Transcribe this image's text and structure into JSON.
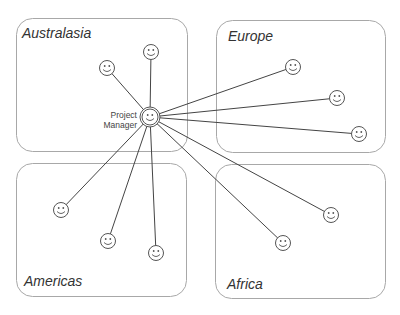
{
  "diagram": {
    "type": "hub-and-spoke organizational diagram",
    "colors": {
      "box_border": "#a8a8a8",
      "line": "#444444",
      "face": "#555555",
      "label": "#333333"
    },
    "hub": {
      "label_line1": "Project",
      "label_line2": "Manager",
      "x": 150,
      "y": 117,
      "icon": "smiley-face-icon"
    },
    "regions": [
      {
        "name": "Australasia",
        "box": [
          16,
          18,
          188,
          152
        ],
        "label_pos": [
          22,
          38
        ],
        "members": [
          {
            "x": 107,
            "y": 68
          },
          {
            "x": 151,
            "y": 52
          }
        ]
      },
      {
        "name": "Europe",
        "box": [
          216,
          20,
          386,
          153
        ],
        "label_pos": [
          228,
          41
        ],
        "members": [
          {
            "x": 293,
            "y": 67
          },
          {
            "x": 337,
            "y": 98
          },
          {
            "x": 359,
            "y": 134
          }
        ]
      },
      {
        "name": "Americas",
        "box": [
          16,
          163,
          187,
          297
        ],
        "label_pos": [
          24,
          286
        ],
        "members": [
          {
            "x": 61,
            "y": 210
          },
          {
            "x": 108,
            "y": 241
          },
          {
            "x": 156,
            "y": 253
          }
        ]
      },
      {
        "name": "Africa",
        "box": [
          215,
          164,
          386,
          299
        ],
        "label_pos": [
          227,
          289
        ],
        "members": [
          {
            "x": 331,
            "y": 215
          },
          {
            "x": 283,
            "y": 243
          }
        ]
      }
    ]
  }
}
